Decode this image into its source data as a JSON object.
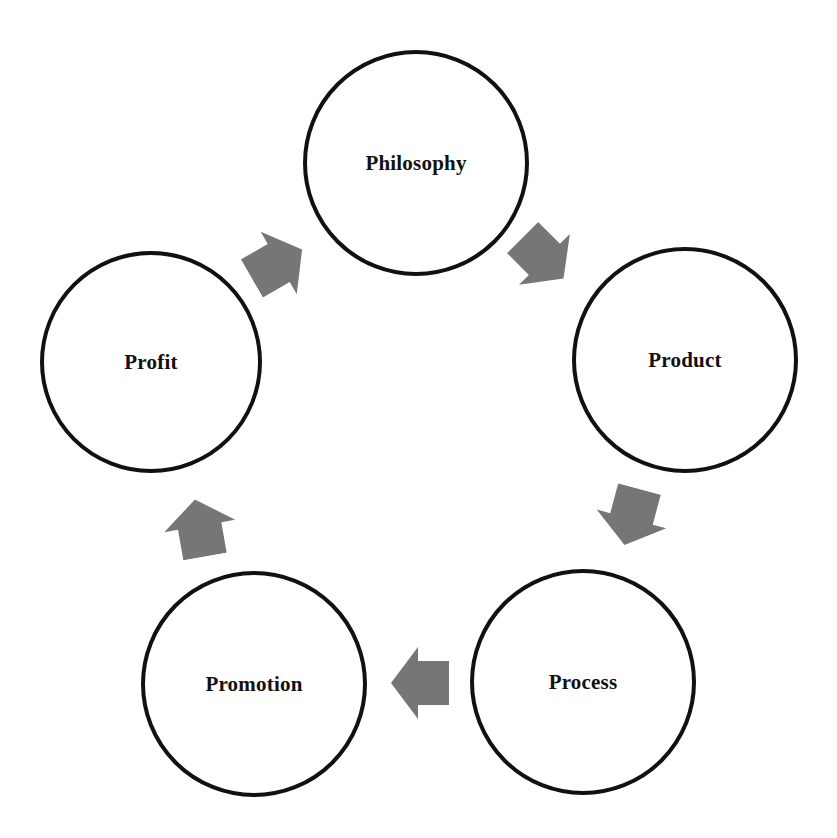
{
  "diagram": {
    "title": "",
    "type": "cycle",
    "colors": {
      "background": "#ffffff",
      "node_border": "#111111",
      "node_text": "#111111",
      "arrow_fill": "#767676"
    },
    "nodes": [
      {
        "id": "philosophy",
        "label": "Philosophy",
        "cx": 416,
        "cy": 163,
        "r": 113
      },
      {
        "id": "product",
        "label": "Product",
        "cx": 685,
        "cy": 360,
        "r": 113
      },
      {
        "id": "process",
        "label": "Process",
        "cx": 583,
        "cy": 682,
        "r": 113
      },
      {
        "id": "promotion",
        "label": "Promotion",
        "cx": 254,
        "cy": 684,
        "r": 113
      },
      {
        "id": "profit",
        "label": "Profit",
        "cx": 151,
        "cy": 362,
        "r": 111
      }
    ],
    "edges": [
      {
        "from": "philosophy",
        "to": "product",
        "direction": "down-right",
        "cx": 543,
        "cy": 258,
        "angle": 45
      },
      {
        "from": "product",
        "to": "process",
        "direction": "down",
        "cx": 632,
        "cy": 517,
        "angle": 105
      },
      {
        "from": "process",
        "to": "promotion",
        "direction": "left",
        "cx": 420,
        "cy": 683,
        "angle": 180
      },
      {
        "from": "promotion",
        "to": "profit",
        "direction": "up",
        "cx": 200,
        "cy": 528,
        "angle": -80
      },
      {
        "from": "profit",
        "to": "philosophy",
        "direction": "up-right",
        "cx": 277,
        "cy": 264,
        "angle": -30
      }
    ]
  }
}
